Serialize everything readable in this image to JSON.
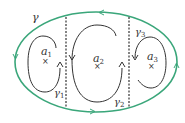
{
  "diagram": {
    "colors": {
      "outer_contour": "#3aa67a",
      "inner_contour": "#333333",
      "divider": "#333333"
    },
    "outer_label": "γ",
    "regions": [
      {
        "point_label": "a",
        "point_sub": "1",
        "contour_label": "γ",
        "contour_sub": "1"
      },
      {
        "point_label": "a",
        "point_sub": "2",
        "contour_label": "γ",
        "contour_sub": "2"
      },
      {
        "point_label": "a",
        "point_sub": "3",
        "contour_label": "γ",
        "contour_sub": "3"
      }
    ],
    "marker": "×"
  }
}
